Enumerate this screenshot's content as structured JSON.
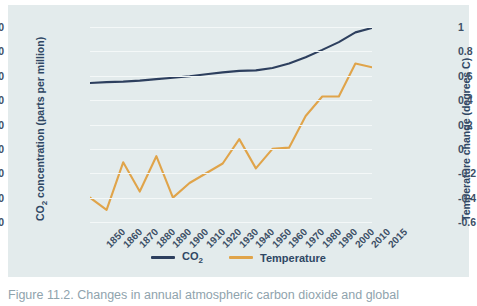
{
  "chart_data": {
    "type": "line",
    "title": "",
    "xlabel": "",
    "categories": [
      "1850",
      "1860",
      "1870",
      "1880",
      "1890",
      "1900",
      "1910",
      "1920",
      "1930",
      "1940",
      "1950",
      "1960",
      "1970",
      "1980",
      "1990",
      "2000",
      "2010",
      "2015"
    ],
    "grid": true,
    "legend_position": "bottom-center",
    "axes": {
      "left": {
        "label": "CO2 concentration (parts per million)",
        "label_prefix": "CO",
        "label_subscript": "2",
        "label_suffix": " concentration (parts per million)",
        "ticks": [
          "0",
          "50",
          "100",
          "150",
          "200",
          "250",
          "300",
          "350",
          "400"
        ],
        "tick_values": [
          0,
          50,
          100,
          150,
          200,
          250,
          300,
          350,
          400
        ],
        "ylim": [
          0,
          400
        ]
      },
      "right": {
        "label": "Temperature change (degrees C)",
        "ticks": [
          "-0.6",
          "-0.4",
          "-0.2",
          "0",
          "0.2",
          "0.4",
          "0.6",
          "0.8",
          "1"
        ],
        "tick_values": [
          -0.6,
          -0.4,
          -0.2,
          0,
          0.2,
          0.4,
          0.6,
          0.8,
          1
        ],
        "ylim": [
          -0.6,
          1
        ]
      }
    },
    "series": [
      {
        "name": "CO2",
        "legend_label": "CO2",
        "legend_label_prefix": "CO",
        "legend_label_subscript": "2",
        "color": "#2d3f5e",
        "axis": "left",
        "unit": "ppm",
        "values": [
          285,
          287,
          288,
          290,
          293,
          296,
          299,
          303,
          307,
          310,
          311,
          316,
          325,
          338,
          353,
          369,
          389,
          398
        ]
      },
      {
        "name": "Temperature",
        "legend_label": "Temperature",
        "color": "#e0a44a",
        "axis": "right",
        "unit": "degrees C",
        "values": [
          -0.4,
          -0.5,
          -0.11,
          -0.35,
          -0.06,
          -0.4,
          -0.28,
          -0.2,
          -0.12,
          0.08,
          -0.16,
          0.0,
          0.01,
          0.27,
          0.43,
          0.43,
          0.7,
          0.67
        ]
      }
    ]
  },
  "colors": {
    "panel_background": "#e3ebec",
    "page_background": "#ffffff",
    "gridline": "#f4f8f8",
    "co2_line": "#2d3f5e",
    "temperature_line": "#e0a44a",
    "tick_text": "#3d4f66",
    "axis_title_text": "#2f4764",
    "caption_text": "#8fa3ad"
  },
  "caption": {
    "text": "Figure 11.2. Changes in annual atmospheric carbon dioxide and global"
  }
}
